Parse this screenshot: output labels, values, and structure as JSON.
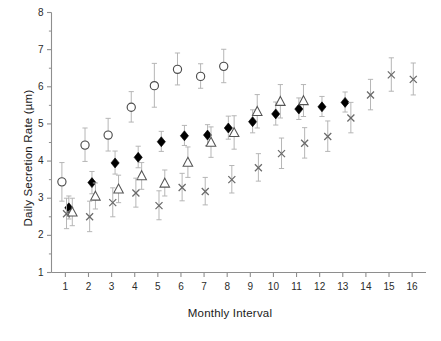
{
  "chart_data": {
    "type": "scatter",
    "title": "",
    "xlabel": "Monthly Interval",
    "ylabel": "Daily Secretion Rate (µm)",
    "xlim": [
      0.4,
      16.6
    ],
    "ylim": [
      1,
      8
    ],
    "yticks": [
      1,
      2,
      3,
      4,
      5,
      6,
      7,
      8
    ],
    "xticks": [
      1,
      2,
      3,
      4,
      5,
      6,
      7,
      8,
      9,
      10,
      11,
      12,
      13,
      14,
      15,
      16
    ],
    "ytick_labels": [
      "1",
      "2",
      "3",
      "4",
      "5",
      "6",
      "7",
      "8"
    ],
    "xtick_labels": [
      "1",
      "2",
      "3",
      "4",
      "5",
      "6",
      "7",
      "8",
      "9",
      "10",
      "11",
      "12",
      "13",
      "14",
      "15",
      "16"
    ],
    "grid": false,
    "legend": "none",
    "errorbars": "vertical",
    "series": [
      {
        "name": "open-circle",
        "marker": "circle-open",
        "color": "#4d4d4d",
        "points": [
          {
            "x": 0.85,
            "y": 3.44,
            "err_low": 0.52,
            "err_high": 0.52
          },
          {
            "x": 1.85,
            "y": 4.43,
            "err_low": 0.44,
            "err_high": 0.46
          },
          {
            "x": 2.85,
            "y": 4.7,
            "err_low": 0.43,
            "err_high": 0.45
          },
          {
            "x": 3.85,
            "y": 5.45,
            "err_low": 0.4,
            "err_high": 0.42
          },
          {
            "x": 4.85,
            "y": 6.03,
            "err_low": 0.58,
            "err_high": 0.6
          },
          {
            "x": 5.85,
            "y": 6.47,
            "err_low": 0.42,
            "err_high": 0.44
          },
          {
            "x": 6.85,
            "y": 6.28,
            "err_low": 0.32,
            "err_high": 0.34
          },
          {
            "x": 7.85,
            "y": 6.55,
            "err_low": 0.44,
            "err_high": 0.46
          }
        ]
      },
      {
        "name": "filled-diamond",
        "marker": "diamond-filled",
        "color": "#000000",
        "points": [
          {
            "x": 1.15,
            "y": 2.74,
            "err_low": 0.3,
            "err_high": 0.32
          },
          {
            "x": 2.15,
            "y": 3.42,
            "err_low": 0.3,
            "err_high": 0.3
          },
          {
            "x": 3.15,
            "y": 3.95,
            "err_low": 0.3,
            "err_high": 0.32
          },
          {
            "x": 4.15,
            "y": 4.1,
            "err_low": 0.28,
            "err_high": 0.3
          },
          {
            "x": 5.15,
            "y": 4.52,
            "err_low": 0.26,
            "err_high": 0.28
          },
          {
            "x": 6.15,
            "y": 4.68,
            "err_low": 0.26,
            "err_high": 0.28
          },
          {
            "x": 7.15,
            "y": 4.7,
            "err_low": 0.28,
            "err_high": 0.28
          },
          {
            "x": 8.05,
            "y": 4.89,
            "err_low": 0.3,
            "err_high": 0.32
          },
          {
            "x": 9.1,
            "y": 5.06,
            "err_low": 0.3,
            "err_high": 0.32
          },
          {
            "x": 10.1,
            "y": 5.27,
            "err_low": 0.3,
            "err_high": 0.32
          },
          {
            "x": 11.1,
            "y": 5.4,
            "err_low": 0.28,
            "err_high": 0.3
          },
          {
            "x": 12.1,
            "y": 5.46,
            "err_low": 0.26,
            "err_high": 0.28
          },
          {
            "x": 13.1,
            "y": 5.58,
            "err_low": 0.26,
            "err_high": 0.28
          }
        ]
      },
      {
        "name": "open-triangle",
        "marker": "triangle-open",
        "color": "#555555",
        "points": [
          {
            "x": 1.3,
            "y": 2.62,
            "err_low": 0.36,
            "err_high": 0.38
          },
          {
            "x": 2.3,
            "y": 3.05,
            "err_low": 0.34,
            "err_high": 0.36
          },
          {
            "x": 3.3,
            "y": 3.24,
            "err_low": 0.36,
            "err_high": 0.38
          },
          {
            "x": 4.3,
            "y": 3.6,
            "err_low": 0.36,
            "err_high": 0.36
          },
          {
            "x": 5.3,
            "y": 3.4,
            "err_low": 0.34,
            "err_high": 0.36
          },
          {
            "x": 6.3,
            "y": 3.96,
            "err_low": 0.4,
            "err_high": 0.42
          },
          {
            "x": 7.3,
            "y": 4.5,
            "err_low": 0.4,
            "err_high": 0.42
          },
          {
            "x": 8.3,
            "y": 4.76,
            "err_low": 0.44,
            "err_high": 0.46
          },
          {
            "x": 9.3,
            "y": 5.33,
            "err_low": 0.44,
            "err_high": 0.46
          },
          {
            "x": 10.3,
            "y": 5.6,
            "err_low": 0.44,
            "err_high": 0.46
          },
          {
            "x": 11.3,
            "y": 5.62,
            "err_low": 0.42,
            "err_high": 0.44
          }
        ]
      },
      {
        "name": "cross-marker",
        "marker": "x",
        "color": "#6a6a6a",
        "points": [
          {
            "x": 1.05,
            "y": 2.58,
            "err_low": 0.4,
            "err_high": 0.42
          },
          {
            "x": 2.05,
            "y": 2.5,
            "err_low": 0.4,
            "err_high": 0.42
          },
          {
            "x": 3.05,
            "y": 2.88,
            "err_low": 0.38,
            "err_high": 0.4
          },
          {
            "x": 4.05,
            "y": 3.14,
            "err_low": 0.38,
            "err_high": 0.4
          },
          {
            "x": 5.05,
            "y": 2.8,
            "err_low": 0.38,
            "err_high": 0.4
          },
          {
            "x": 6.05,
            "y": 3.29,
            "err_low": 0.36,
            "err_high": 0.38
          },
          {
            "x": 7.05,
            "y": 3.18,
            "err_low": 0.36,
            "err_high": 0.38
          },
          {
            "x": 8.2,
            "y": 3.5,
            "err_low": 0.36,
            "err_high": 0.38
          },
          {
            "x": 9.35,
            "y": 3.82,
            "err_low": 0.36,
            "err_high": 0.38
          },
          {
            "x": 10.35,
            "y": 4.2,
            "err_low": 0.4,
            "err_high": 0.42
          },
          {
            "x": 11.35,
            "y": 4.48,
            "err_low": 0.4,
            "err_high": 0.42
          },
          {
            "x": 12.35,
            "y": 4.66,
            "err_low": 0.4,
            "err_high": 0.42
          },
          {
            "x": 13.35,
            "y": 5.16,
            "err_low": 0.4,
            "err_high": 0.42
          },
          {
            "x": 14.2,
            "y": 5.78,
            "err_low": 0.4,
            "err_high": 0.42
          },
          {
            "x": 15.1,
            "y": 6.32,
            "err_low": 0.44,
            "err_high": 0.46
          },
          {
            "x": 16.05,
            "y": 6.2,
            "err_low": 0.42,
            "err_high": 0.44
          }
        ]
      }
    ]
  },
  "caption": {
    "text": ""
  }
}
